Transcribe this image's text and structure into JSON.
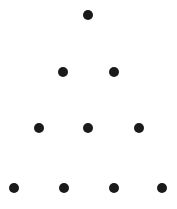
{
  "figure": {
    "background_color": "#ffffff",
    "dot_color": "#1a1a1a",
    "width": 177,
    "height": 209
  },
  "chart_data": {
    "type": "scatter",
    "title": "",
    "xlabel": "",
    "ylabel": "",
    "grid": false,
    "legend": null,
    "xlim": [
      0,
      177
    ],
    "ylim": [
      0,
      209
    ],
    "total_dots": 10,
    "row_counts": [
      1,
      2,
      3,
      4
    ],
    "dot_diameter": 10,
    "marker": "circle",
    "marker_color": "#1a1a1a",
    "rows": [
      {
        "index": 1,
        "count": 1,
        "y": 15,
        "dots": [
          {
            "x": 88,
            "y": 15,
            "d": 10
          }
        ]
      },
      {
        "index": 2,
        "count": 2,
        "y": 72,
        "dots": [
          {
            "x": 63,
            "y": 72,
            "d": 10
          },
          {
            "x": 114,
            "y": 72,
            "d": 10
          }
        ]
      },
      {
        "index": 3,
        "count": 3,
        "y": 128,
        "dots": [
          {
            "x": 39,
            "y": 128,
            "d": 10
          },
          {
            "x": 88,
            "y": 128,
            "d": 10
          },
          {
            "x": 139,
            "y": 128,
            "d": 10
          }
        ]
      },
      {
        "index": 4,
        "count": 4,
        "y": 188,
        "dots": [
          {
            "x": 14,
            "y": 188,
            "d": 10
          },
          {
            "x": 64,
            "y": 188,
            "d": 10
          },
          {
            "x": 114,
            "y": 188,
            "d": 10
          },
          {
            "x": 162,
            "y": 188,
            "d": 10
          }
        ]
      }
    ],
    "points": [
      {
        "x": 88,
        "y": 15,
        "row": 1,
        "col": 1
      },
      {
        "x": 63,
        "y": 72,
        "row": 2,
        "col": 1
      },
      {
        "x": 114,
        "y": 72,
        "row": 2,
        "col": 2
      },
      {
        "x": 39,
        "y": 128,
        "row": 3,
        "col": 1
      },
      {
        "x": 88,
        "y": 128,
        "row": 3,
        "col": 2
      },
      {
        "x": 139,
        "y": 128,
        "row": 3,
        "col": 3
      },
      {
        "x": 14,
        "y": 188,
        "row": 4,
        "col": 1
      },
      {
        "x": 64,
        "y": 188,
        "row": 4,
        "col": 2
      },
      {
        "x": 114,
        "y": 188,
        "row": 4,
        "col": 3
      },
      {
        "x": 162,
        "y": 188,
        "row": 4,
        "col": 4
      }
    ]
  }
}
